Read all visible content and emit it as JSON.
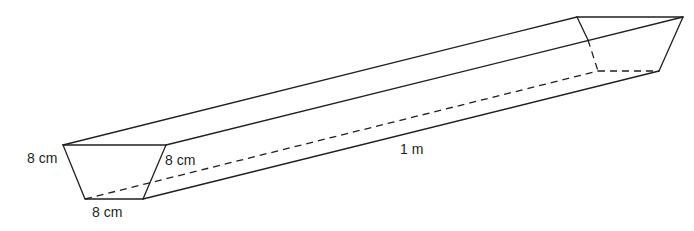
{
  "figure": {
    "type": "trapezoidal prism (trough)",
    "labels": {
      "left_side": "8 cm",
      "right_side": "8 cm",
      "bottom": "8 cm",
      "length": "1 m"
    },
    "colors": {
      "line": "#231f20",
      "background": "#ffffff"
    }
  }
}
